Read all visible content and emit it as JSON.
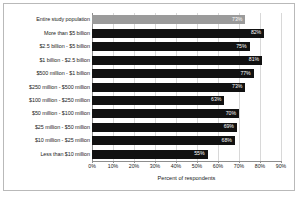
{
  "chart_data": {
    "type": "bar",
    "orientation": "horizontal",
    "title": "",
    "xlabel": "Percent of respondents",
    "ylabel": "",
    "xlim": [
      0,
      90
    ],
    "xticks": [
      "0%",
      "10%",
      "20%",
      "30%",
      "40%",
      "50%",
      "60%",
      "70%",
      "80%",
      "90%"
    ],
    "xtick_values": [
      0,
      10,
      20,
      30,
      40,
      50,
      60,
      70,
      80,
      90
    ],
    "grid": "vertical",
    "legend": "none",
    "categories": [
      "Entire study population",
      "More than $5 billion",
      "$2.5 billion - $5 billion",
      "$1 billion - $2.5 billion",
      "$500 million - $1 billion",
      "$250 million - $500 million",
      "$100 million - $250 million",
      "$50 million - $100 million",
      "$25 million - $50 million",
      "$10 million - $25 million",
      "Less than $10 million"
    ],
    "values": [
      73,
      82,
      75,
      81,
      77,
      73,
      63,
      70,
      69,
      68,
      55
    ],
    "data_labels": [
      "73%",
      "82%",
      "75%",
      "81%",
      "77%",
      "73%",
      "63%",
      "70%",
      "69%",
      "68%",
      "55%"
    ],
    "colors": {
      "highlight_bar": "#9b9b9b",
      "bar": "#111111",
      "gridline": "#d8d8d8",
      "axis": "#8d8d8d",
      "frame": "#b9b9b9",
      "data_label_text": "#ffffff"
    },
    "highlight_index": 0
  }
}
